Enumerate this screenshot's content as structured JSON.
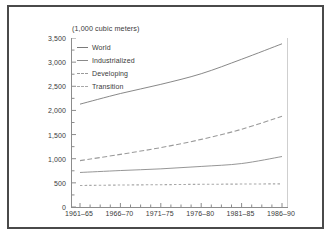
{
  "figure": {
    "title": "(1,000 cubic meters)",
    "frame_color": "#4a4a4a",
    "axis_color": "#8c8c8c",
    "text_color": "#3a3a3a"
  },
  "legend": {
    "position": "top-left-inside",
    "items": [
      {
        "label": "World",
        "style": "solid",
        "color": "#7a7a7a"
      },
      {
        "label": "Industrialized",
        "style": "solid",
        "color": "#8a8a8a"
      },
      {
        "label": "Developing",
        "style": "dashed",
        "color": "#9a9a9a"
      },
      {
        "label": "Transition",
        "style": "dotted",
        "color": "#a8a8a8"
      }
    ]
  },
  "chart_data": {
    "type": "line",
    "title": "(1,000 cubic meters)",
    "xlabel": "",
    "ylabel": "",
    "ylim": [
      0,
      3500
    ],
    "yticks": [
      0,
      500,
      1000,
      1500,
      2000,
      2500,
      3000,
      3500
    ],
    "ytick_labels": [
      "0",
      "500",
      "1,000",
      "1,500",
      "2,000",
      "2,500",
      "3,000",
      "3,500"
    ],
    "categories": [
      "1961–65",
      "1966–70",
      "1971–75",
      "1976–80",
      "1981–85",
      "1986–90"
    ],
    "grid": false,
    "legend_position": "upper left",
    "minor_ticks": true,
    "series": [
      {
        "name": "World",
        "style": "solid",
        "color": "#7a7a7a",
        "values": [
          2130,
          2350,
          2540,
          2760,
          3060,
          3380
        ]
      },
      {
        "name": "Industrialized",
        "style": "solid",
        "color": "#8a8a8a",
        "values": [
          715,
          755,
          790,
          840,
          900,
          1045
        ]
      },
      {
        "name": "Developing",
        "style": "dashed",
        "color": "#9a9a9a",
        "values": [
          960,
          1090,
          1230,
          1400,
          1610,
          1880
        ]
      },
      {
        "name": "Transition",
        "style": "dotted",
        "color": "#a8a8a8",
        "values": [
          445,
          455,
          462,
          470,
          475,
          480
        ]
      }
    ]
  }
}
